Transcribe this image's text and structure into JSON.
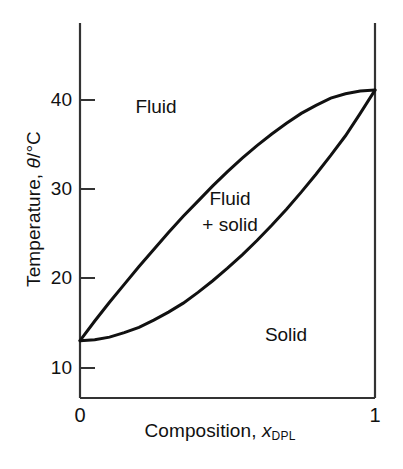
{
  "figure": {
    "kind": "binary-phase-diagram",
    "line_color": "#111111",
    "axis_color": "#333333",
    "background": "#ffffff"
  },
  "axes": {
    "y": {
      "title_prefix": "Temperature, ",
      "title_symbol": "θ",
      "title_suffix": "/°C",
      "title_full": "Temperature, θ/°C",
      "ticks": [
        10,
        20,
        30,
        40
      ],
      "tick_labels": [
        "10",
        "20",
        "30",
        "40"
      ],
      "range": [
        5.6,
        47.5
      ],
      "tick_direction": "inward"
    },
    "x": {
      "title_prefix": "Composition, ",
      "title_symbol": "x",
      "title_subscript": "DPL",
      "title_full": "Composition, x_DPL",
      "ticks": [
        0,
        1
      ],
      "tick_labels": [
        "0",
        "1"
      ],
      "range": [
        0,
        1
      ]
    }
  },
  "regions": [
    {
      "id": "fluid",
      "label": "Fluid"
    },
    {
      "id": "fluid-plus-solid",
      "label_line1": "Fluid",
      "label_line2": "+ solid"
    },
    {
      "id": "solid",
      "label": "Solid"
    }
  ],
  "chart_data": {
    "type": "line",
    "title": "",
    "xlabel": "Composition, x_DPL",
    "ylabel": "Temperature, θ/°C",
    "xlim": [
      0,
      1
    ],
    "ylim": [
      5.6,
      47.5
    ],
    "grid": false,
    "legend": null,
    "annotations": [
      {
        "text": "Fluid",
        "x": 0.2,
        "y": 41.5
      },
      {
        "text": "Fluid + solid",
        "x": 0.5,
        "y": 29.5
      },
      {
        "text": "Solid",
        "x": 0.7,
        "y": 17.0
      }
    ],
    "x": [
      0.0,
      0.05,
      0.1,
      0.15,
      0.2,
      0.25,
      0.3,
      0.35,
      0.4,
      0.45,
      0.5,
      0.55,
      0.6,
      0.65,
      0.7,
      0.75,
      0.8,
      0.85,
      0.9,
      0.95,
      1.0
    ],
    "series": [
      {
        "name": "liquidus",
        "label": "Upper boundary (fluid / fluid+solid)",
        "values": [
          12.0,
          14.2,
          16.3,
          18.3,
          20.3,
          22.2,
          24.1,
          25.9,
          27.6,
          29.3,
          30.9,
          32.4,
          33.8,
          35.1,
          36.3,
          37.4,
          38.3,
          39.1,
          39.6,
          39.9,
          40.0
        ]
      },
      {
        "name": "solidus",
        "label": "Lower boundary (fluid+solid / solid)",
        "values": [
          12.0,
          12.1,
          12.4,
          12.9,
          13.5,
          14.3,
          15.2,
          16.2,
          17.4,
          18.7,
          20.1,
          21.6,
          23.2,
          24.9,
          26.7,
          28.6,
          30.6,
          32.7,
          34.9,
          37.4,
          40.0
        ]
      }
    ],
    "key_points": [
      {
        "name": "left-convergence",
        "x": 0,
        "y": 12.0
      },
      {
        "name": "right-convergence",
        "x": 1,
        "y": 40.0
      }
    ]
  }
}
